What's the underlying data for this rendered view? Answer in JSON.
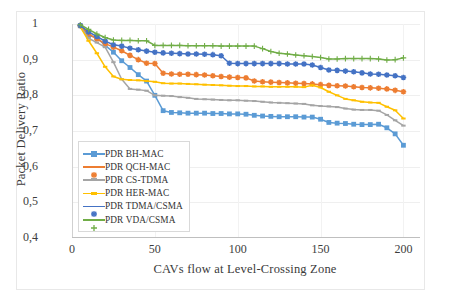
{
  "chart_data": {
    "type": "line",
    "title": "",
    "xlabel": "CAVs flow at Level-Crossing Zone",
    "ylabel": "Packet Delivery Ratio",
    "xlim": [
      0,
      210
    ],
    "ylim": [
      0.4,
      1.0
    ],
    "xticks": [
      "0",
      "50",
      "100",
      "150",
      "200"
    ],
    "xtick_values": [
      0,
      50,
      100,
      150,
      200
    ],
    "yticks": [
      "0,4",
      "0,5",
      "0,6",
      "0,7",
      "0,8",
      "0,9",
      "1"
    ],
    "ytick_values": [
      0.4,
      0.5,
      0.6,
      0.7,
      0.8,
      0.9,
      1.0
    ],
    "grid": true,
    "legend_position": "lower-left-inside",
    "x": [
      5,
      10,
      15,
      20,
      25,
      30,
      35,
      40,
      45,
      50,
      55,
      60,
      65,
      70,
      75,
      80,
      85,
      90,
      95,
      100,
      105,
      110,
      115,
      120,
      125,
      130,
      135,
      140,
      145,
      150,
      155,
      160,
      165,
      170,
      175,
      180,
      185,
      190,
      195,
      200
    ],
    "series": [
      {
        "name": "PDR BH-MAC",
        "color": "#5B9BD5",
        "marker": "square",
        "values": [
          0.995,
          0.968,
          0.962,
          0.94,
          0.921,
          0.897,
          0.878,
          0.858,
          0.84,
          0.8,
          0.757,
          0.752,
          0.751,
          0.75,
          0.75,
          0.75,
          0.749,
          0.749,
          0.748,
          0.748,
          0.747,
          0.744,
          0.742,
          0.741,
          0.74,
          0.74,
          0.74,
          0.739,
          0.739,
          0.733,
          0.724,
          0.722,
          0.721,
          0.719,
          0.718,
          0.718,
          0.719,
          0.709,
          0.692,
          0.66
        ]
      },
      {
        "name": "PDR QCH-MAC",
        "color": "#ED7D31",
        "marker": "star",
        "values": [
          0.995,
          0.972,
          0.958,
          0.945,
          0.935,
          0.925,
          0.912,
          0.9,
          0.89,
          0.889,
          0.862,
          0.86,
          0.859,
          0.859,
          0.858,
          0.857,
          0.855,
          0.853,
          0.851,
          0.85,
          0.849,
          0.84,
          0.838,
          0.837,
          0.836,
          0.835,
          0.834,
          0.833,
          0.832,
          0.83,
          0.828,
          0.827,
          0.826,
          0.824,
          0.822,
          0.821,
          0.82,
          0.818,
          0.814,
          0.81
        ]
      },
      {
        "name": "PDR CS-TDMA",
        "color": "#A5A5A5",
        "marker": "dash",
        "values": [
          0.993,
          0.96,
          0.948,
          0.935,
          0.893,
          0.845,
          0.818,
          0.816,
          0.813,
          0.8,
          0.799,
          0.798,
          0.795,
          0.793,
          0.79,
          0.789,
          0.788,
          0.787,
          0.786,
          0.786,
          0.785,
          0.784,
          0.782,
          0.78,
          0.779,
          0.778,
          0.777,
          0.776,
          0.772,
          0.77,
          0.769,
          0.767,
          0.763,
          0.76,
          0.759,
          0.759,
          0.757,
          0.745,
          0.73,
          0.715
        ]
      },
      {
        "name": "PDR HER-MAC",
        "color": "#FFC000",
        "marker": "dash",
        "values": [
          0.992,
          0.953,
          0.918,
          0.88,
          0.853,
          0.845,
          0.843,
          0.842,
          0.84,
          0.838,
          0.834,
          0.833,
          0.833,
          0.832,
          0.831,
          0.83,
          0.829,
          0.828,
          0.827,
          0.826,
          0.826,
          0.825,
          0.825,
          0.824,
          0.824,
          0.824,
          0.824,
          0.823,
          0.828,
          0.822,
          0.81,
          0.8,
          0.79,
          0.786,
          0.782,
          0.78,
          0.779,
          0.768,
          0.758,
          0.735
        ]
      },
      {
        "name": "PDR TDMA/CSMA",
        "color": "#4472C4",
        "marker": "star",
        "values": [
          0.996,
          0.978,
          0.965,
          0.952,
          0.942,
          0.938,
          0.932,
          0.928,
          0.924,
          0.921,
          0.919,
          0.918,
          0.917,
          0.916,
          0.916,
          0.915,
          0.914,
          0.911,
          0.89,
          0.889,
          0.889,
          0.889,
          0.889,
          0.889,
          0.889,
          0.888,
          0.888,
          0.888,
          0.885,
          0.878,
          0.871,
          0.87,
          0.868,
          0.866,
          0.863,
          0.86,
          0.859,
          0.857,
          0.855,
          0.85
        ]
      },
      {
        "name": "PDR VDA/CSMA",
        "color": "#70AD47",
        "marker": "plus",
        "values": [
          0.998,
          0.985,
          0.972,
          0.962,
          0.955,
          0.954,
          0.954,
          0.953,
          0.953,
          0.94,
          0.94,
          0.94,
          0.94,
          0.939,
          0.939,
          0.939,
          0.939,
          0.938,
          0.938,
          0.938,
          0.938,
          0.938,
          0.931,
          0.923,
          0.918,
          0.916,
          0.913,
          0.911,
          0.909,
          0.906,
          0.902,
          0.902,
          0.903,
          0.903,
          0.903,
          0.903,
          0.902,
          0.899,
          0.9,
          0.905
        ]
      }
    ]
  }
}
